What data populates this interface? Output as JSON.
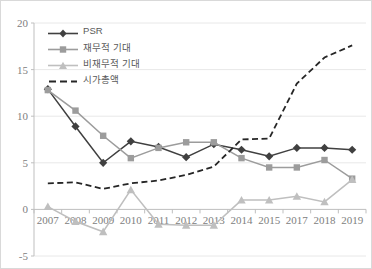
{
  "chart_data": {
    "type": "line",
    "title": "",
    "xlabel": "",
    "ylabel": "",
    "categories": [
      "2007",
      "2008",
      "2009",
      "2010",
      "2011",
      "2012",
      "2013",
      "2014",
      "2015",
      "2017",
      "2018",
      "2019"
    ],
    "ylim": [
      -5,
      20
    ],
    "yticks": [
      -5,
      0,
      5,
      10,
      15,
      20
    ],
    "grid": "horizontal",
    "legend_position": "top-left inside plot",
    "series": [
      {
        "name": "PSR",
        "color": "#404040",
        "marker": "diamond",
        "dash": "solid",
        "values": [
          12.9,
          8.9,
          5.0,
          7.3,
          6.7,
          5.6,
          7.0,
          6.4,
          5.7,
          6.6,
          6.6,
          6.4
        ]
      },
      {
        "name": "재무적 기대",
        "color": "#9c9c9c",
        "marker": "square",
        "dash": "solid",
        "values": [
          12.8,
          10.6,
          7.9,
          5.5,
          6.6,
          7.2,
          7.2,
          5.5,
          4.5,
          4.5,
          5.3,
          3.3
        ]
      },
      {
        "name": "비재무적 기대",
        "color": "#bfbfbf",
        "marker": "triangle",
        "dash": "solid",
        "values": [
          0.3,
          -1.3,
          -2.4,
          2.1,
          -1.6,
          -1.7,
          -1.7,
          1.0,
          1.0,
          1.4,
          0.8,
          3.2
        ]
      },
      {
        "name": "시가총액",
        "color": "#262626",
        "marker": "none",
        "dash": "dashed",
        "values": [
          2.8,
          2.9,
          2.2,
          2.8,
          3.1,
          3.7,
          4.6,
          7.5,
          7.6,
          13.5,
          16.3,
          17.6
        ]
      }
    ]
  },
  "axis": {
    "y_tick_labels": [
      "20",
      "15",
      "10",
      "5",
      "0",
      "-5"
    ],
    "x_tick_labels": [
      "2007",
      "2008",
      "2009",
      "2010",
      "2011",
      "2012",
      "2013",
      "2014",
      "2015",
      "2017",
      "2018",
      "2019"
    ]
  },
  "legend": {
    "items": [
      {
        "label": "PSR"
      },
      {
        "label": "재무적 기대"
      },
      {
        "label": "비재무적 기대"
      },
      {
        "label": "시가총액"
      }
    ]
  },
  "colors": {
    "psr": "#404040",
    "financial": "#9c9c9c",
    "nonfinancial": "#bfbfbf",
    "marketcap": "#262626",
    "grid": "#e8e8e8",
    "axis": "#bfbfbf",
    "text": "#808080"
  }
}
